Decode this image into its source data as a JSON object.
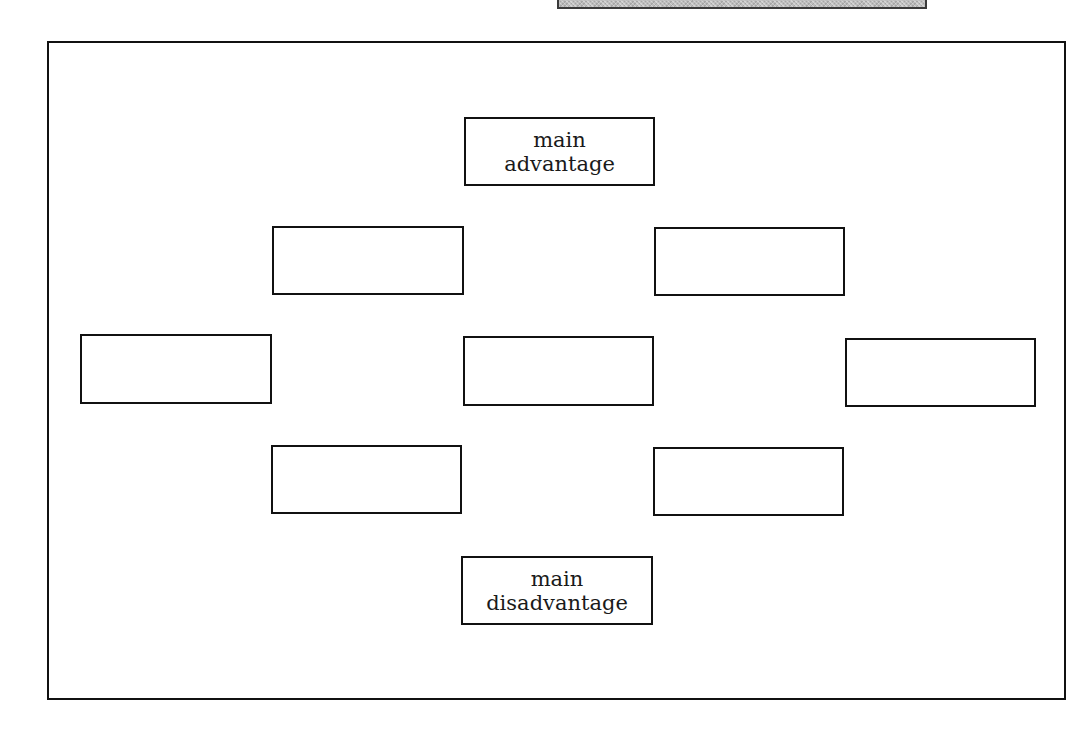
{
  "diagram": {
    "type": "pros-cons-organizer",
    "colors": {
      "stroke": "#111111",
      "background": "#ffffff",
      "strip": "#bdbdbd"
    },
    "top_strip": {
      "label": ""
    },
    "nodes": {
      "main_advantage": {
        "label": "main\nadvantage"
      },
      "upper_left": {
        "label": ""
      },
      "upper_right": {
        "label": ""
      },
      "middle_left": {
        "label": ""
      },
      "center": {
        "label": ""
      },
      "middle_right": {
        "label": ""
      },
      "lower_left": {
        "label": ""
      },
      "lower_right": {
        "label": ""
      },
      "main_disadvantage": {
        "label": "main\ndisadvantage"
      }
    }
  }
}
